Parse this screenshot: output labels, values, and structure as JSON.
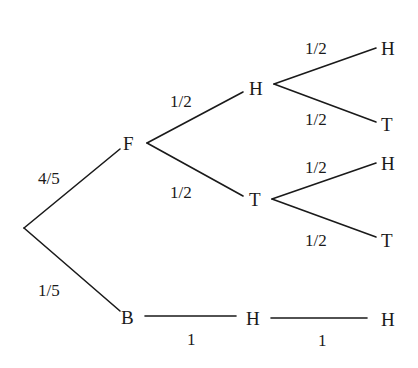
{
  "diagram": {
    "type": "probability-tree",
    "nodes": {
      "F": "F",
      "B": "B",
      "FH": "H",
      "FT": "T",
      "FHH": "H",
      "FHT": "T",
      "FTH": "H",
      "FTT": "T",
      "BH": "H",
      "BHH": "H"
    },
    "probabilities": {
      "root_F": "4/5",
      "root_B": "1/5",
      "F_H": "1/2",
      "F_T": "1/2",
      "FH_H": "1/2",
      "FH_T": "1/2",
      "FT_H": "1/2",
      "FT_T": "1/2",
      "B_H": "1",
      "BH_H": "1"
    }
  }
}
